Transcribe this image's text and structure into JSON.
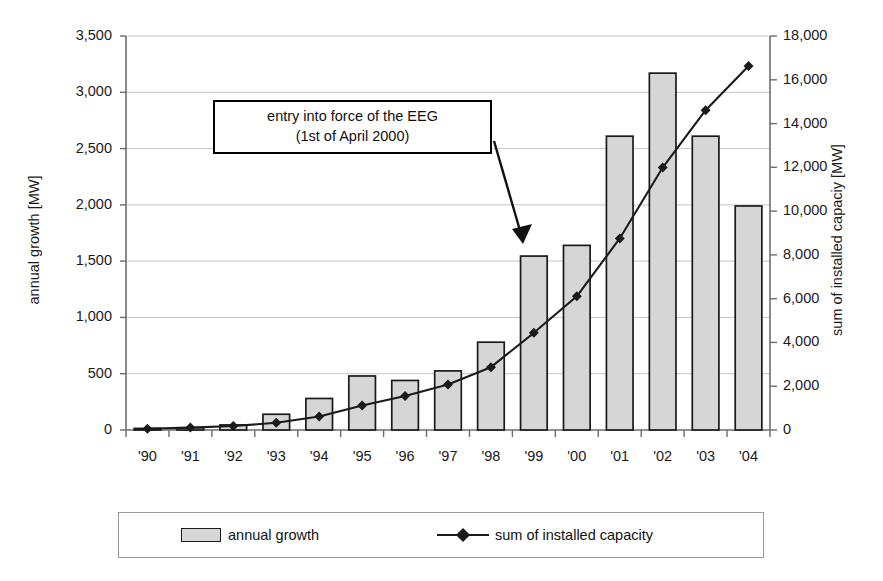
{
  "chart_data": {
    "type": "bar",
    "title": "",
    "subtitle": "",
    "xlabel": "",
    "ylabel": "annual growth [MW]",
    "y2label": "sum of installed capaciy [MW]",
    "categories": [
      "'90",
      "'91",
      "'92",
      "'93",
      "'94",
      "'95",
      "'96",
      "'97",
      "'98",
      "'99",
      "'00",
      "'01",
      "'02",
      "'03",
      "'04"
    ],
    "xticklabels": [
      "'90",
      "'91",
      "'92",
      "'93",
      "'94",
      "'95",
      "'96",
      "'97",
      "'98",
      "'99",
      "'00",
      "'01",
      "'02",
      "'03",
      "'04"
    ],
    "ylim": [
      0,
      3500
    ],
    "yticks": [
      0,
      500,
      1000,
      1500,
      2000,
      2500,
      3000,
      3500
    ],
    "yticklabels": [
      "0",
      "500",
      "1,000",
      "1,500",
      "2,000",
      "2,500",
      "3,000",
      "3,500"
    ],
    "y2lim": [
      0,
      18000
    ],
    "y2ticks": [
      0,
      2000,
      4000,
      6000,
      8000,
      10000,
      12000,
      14000,
      16000,
      18000
    ],
    "y2ticklabels": [
      "0",
      "2,000",
      "4,000",
      "6,000",
      "8,000",
      "10,000",
      "12,000",
      "14,000",
      "16,000",
      "18,000"
    ],
    "grid": true,
    "grid_axis": "y",
    "legend_position": "bottom",
    "series": [
      {
        "name": "annual growth",
        "type": "bar",
        "axis": "left",
        "color": "#d6d6d6",
        "edgecolor": "#1a1a1a",
        "values": [
          5,
          20,
          45,
          140,
          280,
          480,
          440,
          525,
          780,
          1545,
          1640,
          2610,
          3170,
          2610,
          1990
        ]
      },
      {
        "name": "sum of installed capacity",
        "type": "line",
        "axis": "right",
        "color": "#1a1a1a",
        "marker": "diamond",
        "values": [
          55,
          110,
          180,
          330,
          620,
          1120,
          1550,
          2080,
          2870,
          4440,
          6110,
          8750,
          11990,
          14610,
          16630
        ]
      }
    ],
    "annotations": [
      {
        "name": "eeg-callout",
        "line1": "entry into force of the EEG",
        "line2": "(1st of April 2000)",
        "points_to": "'00"
      }
    ]
  },
  "legend": {
    "items": [
      {
        "label": "annual growth",
        "marker": "bar-swatch"
      },
      {
        "label": "sum of installed capacity",
        "marker": "line-diamond"
      }
    ]
  },
  "colors": {
    "bar_fill": "#d6d6d6",
    "bar_edge": "#1a1a1a",
    "line": "#1a1a1a",
    "grid": "#bdbdbd",
    "axis": "#6e6e6e",
    "background": "#ffffff"
  },
  "icons": {
    "arrow": "arrow-icon",
    "diamond": "diamond-marker-icon"
  }
}
